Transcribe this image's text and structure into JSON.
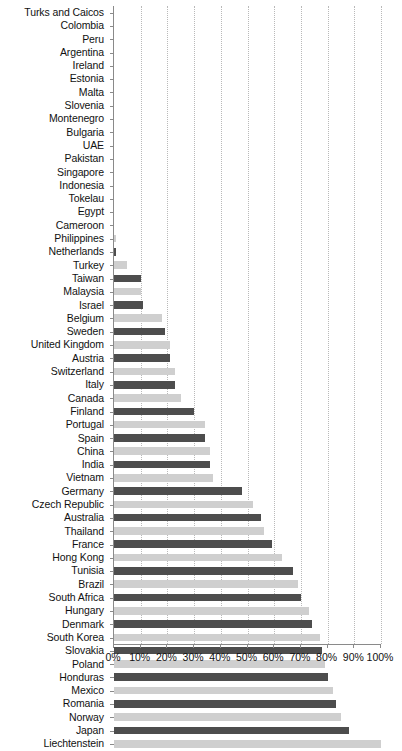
{
  "chart_data": {
    "type": "bar",
    "orientation": "horizontal",
    "title": "",
    "subtitle": "",
    "xlabel": "",
    "ylabel": "",
    "xlim": [
      0,
      100
    ],
    "xtick_labels": [
      "0%",
      "10%",
      "20%",
      "30%",
      "40%",
      "50%",
      "60%",
      "70%",
      "80%",
      "90%",
      "100%"
    ],
    "xtick_values": [
      0,
      10,
      20,
      30,
      40,
      50,
      60,
      70,
      80,
      90,
      100
    ],
    "grid": true,
    "grid_axis": "x",
    "legend": "none",
    "value_suffix": "%",
    "colors": {
      "bar_dark": "#4d4d4d",
      "bar_light": "#cfcfcf",
      "axis": "#8a8a8a",
      "gridline": "#b9b9b9",
      "text": "#111111",
      "background": "#ffffff"
    },
    "categories": [
      "Turks and Caicos",
      "Colombia",
      "Peru",
      "Argentina",
      "Ireland",
      "Estonia",
      "Malta",
      "Slovenia",
      "Montenegro",
      "Bulgaria",
      "UAE",
      "Pakistan",
      "Singapore",
      "Indonesia",
      "Tokelau",
      "Egypt",
      "Cameroon",
      "Philippines",
      "Netherlands",
      "Turkey",
      "Taiwan",
      "Malaysia",
      "Israel",
      "Belgium",
      "Sweden",
      "United Kingdom",
      "Austria",
      "Switzerland",
      "Italy",
      "Canada",
      "Finland",
      "Portugal",
      "Spain",
      "China",
      "India",
      "Vietnam",
      "Germany",
      "Czech Republic",
      "Australia",
      "Thailand",
      "France",
      "Hong Kong",
      "Tunisia",
      "Brazil",
      "South Africa",
      "Hungary",
      "Denmark",
      "South Korea",
      "Slovakia",
      "Poland",
      "Honduras",
      "Mexico",
      "Romania",
      "Norway",
      "Japan",
      "Liechtenstein"
    ],
    "values": [
      0,
      0,
      0,
      0,
      0,
      0,
      0,
      0,
      0,
      0,
      0,
      0,
      0,
      0,
      0,
      0,
      0,
      0.6,
      0.8,
      5,
      10,
      10,
      11,
      18,
      19,
      21,
      21,
      23,
      23,
      25,
      30,
      34,
      34,
      36,
      36,
      37,
      48,
      52,
      55,
      56,
      59,
      63,
      67,
      69,
      70,
      73,
      74,
      77,
      78,
      79,
      80,
      82,
      83,
      85,
      88,
      100
    ]
  }
}
